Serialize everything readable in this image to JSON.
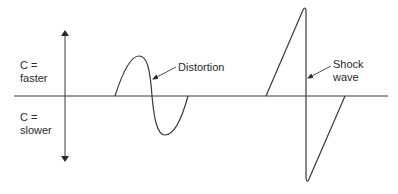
{
  "diagram": {
    "axis": {
      "upper_label_line1": "C =",
      "upper_label_line2": "faster",
      "lower_label_line1": "C =",
      "lower_label_line2": "slower"
    },
    "annotations": {
      "distortion": "Distortion",
      "shock_line1": "Shock",
      "shock_line2": "wave"
    },
    "colors": {
      "stroke": "#3a3a3a",
      "text": "#2a2a2a",
      "background": "#ffffff"
    }
  }
}
